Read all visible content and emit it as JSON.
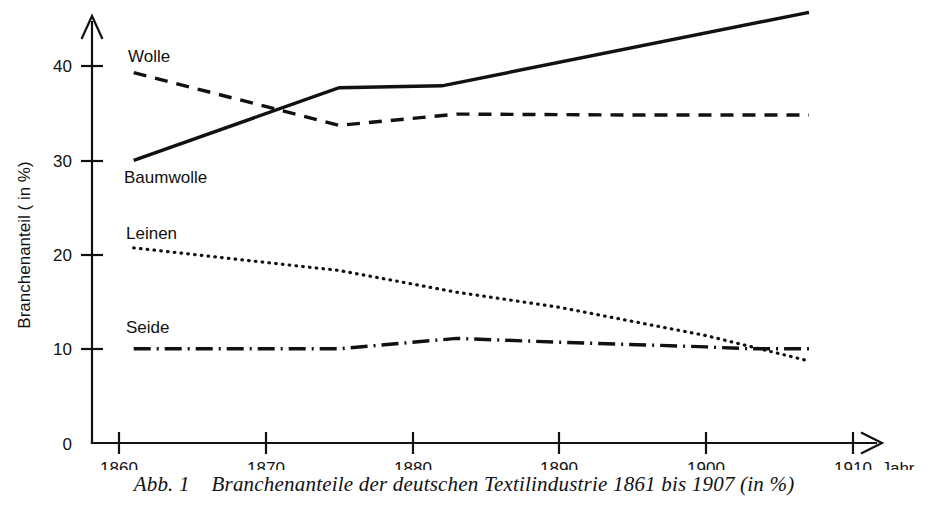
{
  "figure": {
    "caption": "Abb. 1    Branchenanteile der deutschen Textilindustrie 1861 bis 1907 (in %)",
    "y_axis_title": "Branchenanteil ( in %)",
    "x_axis_title": "Jahr"
  },
  "labels": {
    "wolle": "Wolle",
    "baumwolle": "Baumwolle",
    "leinen": "Leinen",
    "seide": "Seide"
  },
  "axes": {
    "x_ticks": [
      "1860",
      "1870",
      "1880",
      "1890",
      "1900",
      "1910"
    ],
    "y_ticks": [
      "0",
      "10",
      "20",
      "30",
      "40"
    ]
  },
  "chart_data": {
    "type": "line",
    "title": "Branchenanteile der deutschen Textilindustrie 1861 bis 1907 (in %)",
    "xlabel": "Jahr",
    "ylabel": "Branchenanteil ( in %)",
    "xlim": [
      1860,
      1910
    ],
    "ylim": [
      0,
      46
    ],
    "xticks": [
      1860,
      1870,
      1880,
      1890,
      1900,
      1910
    ],
    "yticks": [
      0,
      10,
      20,
      30,
      40
    ],
    "grid": false,
    "legend": "inline-labels",
    "series": [
      {
        "name": "Baumwolle",
        "style": "solid",
        "points": [
          [
            1861,
            30.0
          ],
          [
            1875,
            37.7
          ],
          [
            1882,
            37.9
          ],
          [
            1907,
            45.7
          ]
        ]
      },
      {
        "name": "Wolle",
        "style": "dashed",
        "points": [
          [
            1861,
            39.3
          ],
          [
            1875,
            33.7
          ],
          [
            1883,
            34.9
          ],
          [
            1895,
            34.8
          ],
          [
            1907,
            34.8
          ]
        ]
      },
      {
        "name": "Leinen",
        "style": "dotted",
        "points": [
          [
            1861,
            20.7
          ],
          [
            1875,
            18.3
          ],
          [
            1883,
            16.0
          ],
          [
            1890,
            14.4
          ],
          [
            1900,
            11.4
          ],
          [
            1907,
            8.7
          ]
        ]
      },
      {
        "name": "Seide",
        "style": "dash-dot",
        "points": [
          [
            1861,
            10.0
          ],
          [
            1875,
            10.0
          ],
          [
            1883,
            11.1
          ],
          [
            1890,
            10.7
          ],
          [
            1900,
            10.2
          ],
          [
            1903,
            10.0
          ],
          [
            1907,
            10.0
          ]
        ]
      }
    ]
  }
}
